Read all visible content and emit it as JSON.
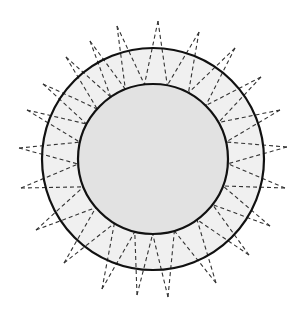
{
  "diagram": {
    "type": "concentric-circles-with-dashed-star",
    "center": [
      153,
      159
    ],
    "outer_circle": {
      "radius": 111,
      "fill": "#f0f0f0",
      "stroke": "#111111",
      "stroke_width": 2.2
    },
    "inner_circle": {
      "radius": 75,
      "fill": "#e2e2e2",
      "stroke": "#111111",
      "stroke_width": 2.2
    },
    "spikes": {
      "stroke": "#333333",
      "stroke_width": 1.1,
      "dash": "4,3",
      "tips": [
        [
          158,
          21
        ],
        [
          199,
          32
        ],
        [
          235,
          48
        ],
        [
          261,
          77
        ],
        [
          280,
          110
        ],
        [
          287,
          147
        ],
        [
          285,
          188
        ],
        [
          270,
          226
        ],
        [
          249,
          255
        ],
        [
          216,
          283
        ],
        [
          168,
          297
        ],
        [
          137,
          295
        ],
        [
          102,
          289
        ],
        [
          64,
          263
        ],
        [
          36,
          230
        ],
        [
          21,
          188
        ],
        [
          19,
          148
        ],
        [
          27,
          110
        ],
        [
          43,
          84
        ],
        [
          66,
          57
        ],
        [
          90,
          41
        ],
        [
          117,
          26
        ]
      ]
    }
  }
}
